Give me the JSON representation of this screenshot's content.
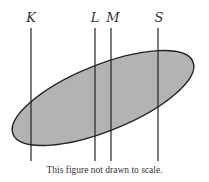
{
  "figure": {
    "labels": {
      "K": "K",
      "L": "L",
      "M": "M",
      "S": "S"
    },
    "caption": "This figure not drawn to scale.",
    "colors": {
      "fill": "#b3b3b3",
      "stroke": "#222222"
    },
    "lines": [
      {
        "name": "K",
        "x": 31
      },
      {
        "name": "L",
        "x": 95
      },
      {
        "name": "M",
        "x": 111
      },
      {
        "name": "S",
        "x": 158
      }
    ]
  }
}
